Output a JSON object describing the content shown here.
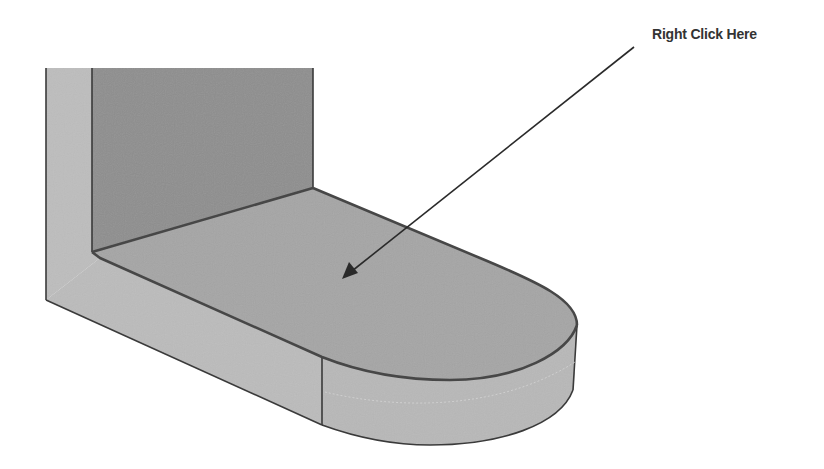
{
  "callout": {
    "label": "Right Click Here"
  },
  "colors": {
    "background": "#ffffff",
    "back_wall": "#8e8e8e",
    "left_face": "#bdbdbd",
    "top_face": "#a5a5a5",
    "front_face": "#bbbbbb",
    "curved_side": "#b8b8b8",
    "edge": "#3a3a3a",
    "arrow": "#2a2a2a"
  }
}
